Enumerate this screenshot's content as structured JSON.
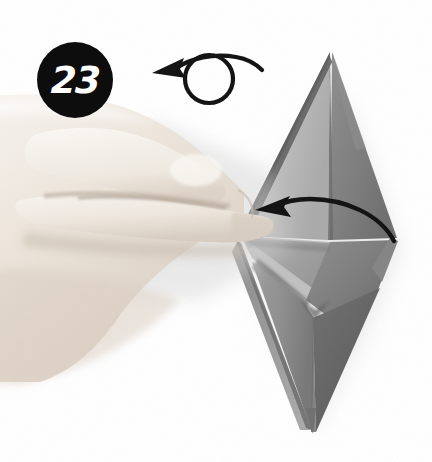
{
  "page": {
    "kind": "origami-instruction-photograph",
    "width": 432,
    "height": 462,
    "background_color": "#ffffff"
  },
  "step": {
    "number": "23",
    "badge_shape": "circle",
    "badge_background_color": "#0d0d0d",
    "badge_text_color": "#ffffff"
  },
  "annotations": {
    "turn_over_arrow": {
      "icon_name": "turn-over-arrow-icon",
      "meaning": "turn model over",
      "stroke_color": "#111111",
      "direction": "counter-clockwise-loop-pointing-left"
    },
    "fold_arrow": {
      "icon_name": "fold-arrow-icon",
      "meaning": "fold flap to the left",
      "stroke_color": "#111111",
      "direction": "right-to-left-curved"
    }
  },
  "subject": {
    "hand": {
      "name": "left-hand",
      "description": "hand entering from left edge, index finger pointing right toward the paper model",
      "skin_highlight_color": "#f4efe9",
      "skin_midtone_color": "#e3d9cf",
      "skin_shadow_color": "#cbbfb4"
    },
    "model": {
      "name": "paper-model",
      "description": "tall gray kite-base origami diamond with upper spike and lower spike",
      "paper_light_color": "#bcbcbc",
      "paper_mid_color": "#9c9c9c",
      "paper_dark_color": "#7c7c7c",
      "paper_darkest_color": "#5e5e5e",
      "crease_color": "#4a4a4a",
      "shadow_color": "#d8d8d8"
    }
  }
}
